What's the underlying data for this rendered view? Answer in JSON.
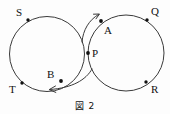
{
  "figure": {
    "caption": "図 2",
    "caption_label": "Figure 2",
    "stroke_color": "#3a3a3a",
    "label_color": "#111111",
    "background_color": "#fdfdfd",
    "width": 170,
    "height": 114
  },
  "circles": [
    {
      "name": "left-circle",
      "cx": 47,
      "cy": 54,
      "r": 37.5
    },
    {
      "name": "right-circle",
      "cx": 126,
      "cy": 53,
      "r": 38
    }
  ],
  "points": [
    {
      "id": "S",
      "label": "S",
      "dot_x": 28,
      "dot_y": 20,
      "label_x": 16,
      "label_y": 7
    },
    {
      "id": "T",
      "label": "T",
      "dot_x": 22,
      "dot_y": 83,
      "label_x": 9,
      "label_y": 84
    },
    {
      "id": "B",
      "label": "B",
      "dot_x": 61,
      "dot_y": 81,
      "label_x": 47,
      "label_y": 69
    },
    {
      "id": "P",
      "label": "P",
      "dot_x": 88,
      "dot_y": 53,
      "label_x": 92,
      "label_y": 48
    },
    {
      "id": "A",
      "label": "A",
      "dot_x": 101,
      "dot_y": 21,
      "label_x": 104,
      "label_y": 25
    },
    {
      "id": "Q",
      "label": "Q",
      "dot_x": 147,
      "dot_y": 20,
      "label_x": 151,
      "label_y": 6
    },
    {
      "id": "R",
      "label": "R",
      "dot_x": 146,
      "dot_y": 82,
      "label_x": 151,
      "label_y": 84
    }
  ],
  "arrows": [
    {
      "name": "upper-arrow",
      "direction": "up-right",
      "path": "M 82 42 C 83 30, 89 20, 98.5 14.5"
    },
    {
      "name": "lower-arrow",
      "direction": "left",
      "path": "M 92 69 C 86 80, 72 88, 50 89.5"
    }
  ]
}
